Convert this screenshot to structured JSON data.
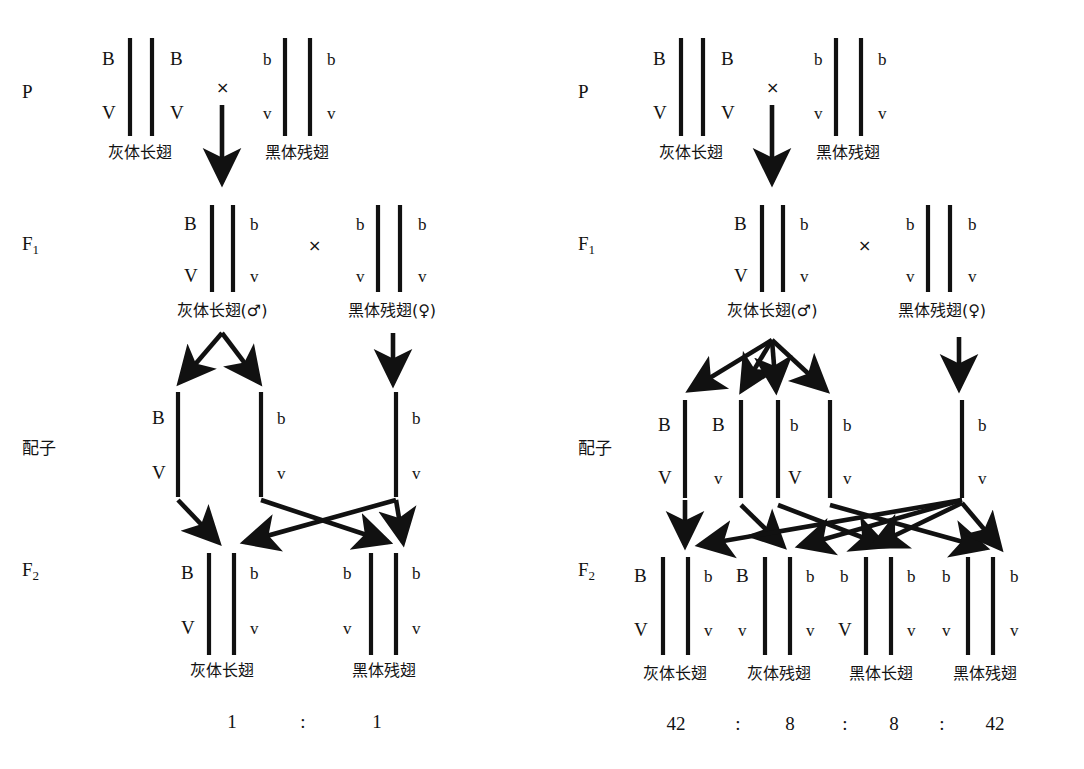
{
  "figure": {
    "stage_labels": {
      "parental": "P",
      "f1": "F",
      "f1_sub": "1",
      "gametes": "配子",
      "f2": "F",
      "f2_sub": "2"
    },
    "cross_symbol": "×",
    "ratio_separator": ":",
    "phenotypes": {
      "grey_long": "灰体长翅",
      "black_vestigial": "黑体残翅",
      "grey_vestigial": "灰体残翅",
      "black_long": "黑体长翅",
      "grey_long_male": "灰体长翅(♂)",
      "black_vestigial_female": "黑体残翅(♀)"
    },
    "alleles": {
      "B_dom": "B",
      "b_rec": "b",
      "V_dom": "V",
      "v_rec": "v"
    }
  },
  "panels": [
    {
      "id": "left",
      "name": "complete-linkage-testcross",
      "parental": {
        "label": "P",
        "male_parent": {
          "top": [
            "B",
            "B"
          ],
          "bottom": [
            "V",
            "V"
          ],
          "phenotype": "灰体长翅"
        },
        "female_parent": {
          "top": [
            "b",
            "b"
          ],
          "bottom": [
            "v",
            "v"
          ],
          "phenotype": "黑体残翅"
        },
        "cross_symbol": "×"
      },
      "f1": {
        "label": "F1",
        "male": {
          "top": [
            "B",
            "b"
          ],
          "bottom": [
            "V",
            "v"
          ],
          "phenotype": "灰体长翅(♂)"
        },
        "female": {
          "top": [
            "b",
            "b"
          ],
          "bottom": [
            "v",
            "v"
          ],
          "phenotype": "黑体残翅(♀)"
        },
        "cross_symbol": "×"
      },
      "gametes": {
        "label": "配子",
        "male_gametes": [
          {
            "top": "B",
            "bottom": "V"
          },
          {
            "top": "b",
            "bottom": "v"
          }
        ],
        "female_gametes": [
          {
            "top": "b",
            "bottom": "v"
          }
        ]
      },
      "f2": {
        "label": "F2",
        "offspring": [
          {
            "top": [
              "B",
              "b"
            ],
            "bottom": [
              "V",
              "v"
            ],
            "phenotype": "灰体长翅",
            "count": "1"
          },
          {
            "top": [
              "b",
              "b"
            ],
            "bottom": [
              "v",
              "v"
            ],
            "phenotype": "黑体残翅",
            "count": "1"
          }
        ],
        "ratio_text": [
          "1",
          ":",
          "1"
        ]
      }
    },
    {
      "id": "right",
      "name": "linkage-with-crossing-over",
      "parental": {
        "label": "P",
        "male_parent": {
          "top": [
            "B",
            "B"
          ],
          "bottom": [
            "V",
            "V"
          ],
          "phenotype": "灰体长翅"
        },
        "female_parent": {
          "top": [
            "b",
            "b"
          ],
          "bottom": [
            "v",
            "v"
          ],
          "phenotype": "黑体残翅"
        },
        "cross_symbol": "×"
      },
      "f1": {
        "label": "F1",
        "male": {
          "top": [
            "B",
            "b"
          ],
          "bottom": [
            "V",
            "v"
          ],
          "phenotype": "灰体长翅(♂)"
        },
        "female": {
          "top": [
            "b",
            "b"
          ],
          "bottom": [
            "v",
            "v"
          ],
          "phenotype": "黑体残翅(♀)"
        },
        "cross_symbol": "×"
      },
      "gametes": {
        "label": "配子",
        "male_gametes": [
          {
            "top": "B",
            "bottom": "V"
          },
          {
            "top": "B",
            "bottom": "v"
          },
          {
            "top": "b",
            "bottom": "V"
          },
          {
            "top": "b",
            "bottom": "v"
          }
        ],
        "female_gametes": [
          {
            "top": "b",
            "bottom": "v"
          }
        ]
      },
      "f2": {
        "label": "F2",
        "offspring": [
          {
            "top": [
              "B",
              "b"
            ],
            "bottom": [
              "V",
              "v"
            ],
            "phenotype": "灰体长翅",
            "count": "42"
          },
          {
            "top": [
              "B",
              "b"
            ],
            "bottom": [
              "v",
              "v"
            ],
            "phenotype": "灰体残翅",
            "count": "8"
          },
          {
            "top": [
              "b",
              "b"
            ],
            "bottom": [
              "V",
              "v"
            ],
            "phenotype": "黑体长翅",
            "count": "8"
          },
          {
            "top": [
              "b",
              "b"
            ],
            "bottom": [
              "v",
              "v"
            ],
            "phenotype": "黑体残翅",
            "count": "42"
          }
        ],
        "ratio_text": [
          "42",
          ":",
          "8",
          ":",
          "8",
          ":",
          "42"
        ]
      }
    }
  ]
}
